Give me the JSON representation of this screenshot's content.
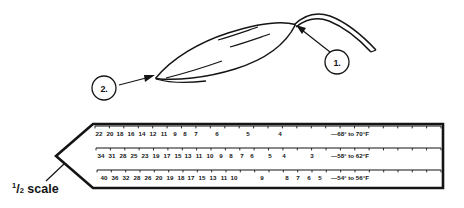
{
  "figure": {
    "title_caption": "1/2 scale",
    "caption_numerator": "1",
    "caption_slash": "/",
    "caption_denominator": "2",
    "caption_word": "scale",
    "ink_color": "#141414",
    "background_color": "#ffffff"
  },
  "callouts": [
    {
      "id": "callout-1",
      "label": "1.",
      "cx": 337,
      "cy": 62,
      "r": 12,
      "target_x": 297,
      "target_y": 26
    },
    {
      "id": "callout-2",
      "label": "2.",
      "cx": 104,
      "cy": 88,
      "r": 12,
      "target_x": 155,
      "target_y": 76
    }
  ],
  "illustration": {
    "name": "leaf-blade-with-stem",
    "parts": [
      "leaf-outline",
      "leaf-vein-upper",
      "leaf-vein-mid",
      "leaf-vein-lower",
      "stem-upper-line",
      "stem-lower-line"
    ]
  },
  "scale_chart": {
    "name": "tapered-scale-ruler",
    "rows": [
      {
        "id": "row-1",
        "temperature_label": "—68° to 70°F",
        "values": [
          22,
          20,
          18,
          16,
          14,
          12,
          11,
          9,
          8,
          7,
          6,
          5,
          4
        ],
        "positions": [
          99,
          110,
          120,
          131,
          142,
          153,
          164,
          175,
          185,
          196,
          217,
          248,
          280
        ]
      },
      {
        "id": "row-2",
        "temperature_label": "—58° to 62°F",
        "values": [
          34,
          31,
          28,
          25,
          23,
          19,
          17,
          15,
          13,
          11,
          10,
          9,
          8,
          7,
          6,
          5,
          4,
          3
        ],
        "positions": [
          101,
          112,
          123,
          134,
          145,
          156,
          167,
          178,
          188,
          199,
          210,
          221,
          231,
          242,
          252,
          270,
          284,
          312
        ]
      },
      {
        "id": "row-3",
        "temperature_label": "—54° to 56°F",
        "values": [
          40,
          36,
          32,
          28,
          26,
          20,
          19,
          18,
          17,
          15,
          13,
          11,
          10,
          9,
          8,
          7,
          6,
          5
        ],
        "positions": [
          104,
          115,
          126,
          137,
          148,
          159,
          170,
          181,
          191,
          202,
          213,
          224,
          234,
          262,
          287,
          298,
          309,
          320
        ]
      }
    ],
    "temp_label_x": 331,
    "row_y": [
      134,
      156,
      178
    ],
    "tick_count": 24
  }
}
